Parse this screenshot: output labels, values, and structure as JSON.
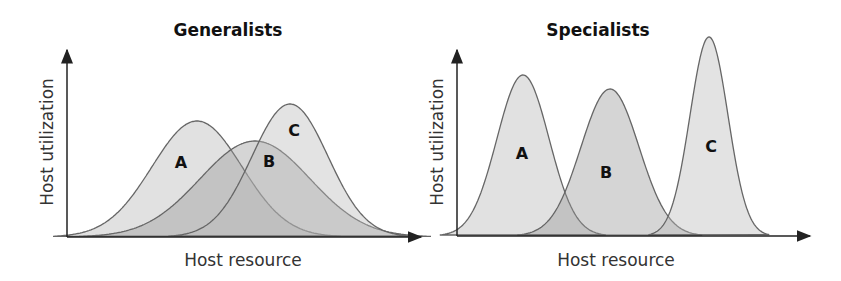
{
  "panels": [
    {
      "title": "Generalists",
      "xlabel": "Host resource",
      "ylabel": "Host utilization",
      "curves": [
        {
          "label": "A",
          "peak_x": 197,
          "peak_y": 121,
          "sigma": 45
        },
        {
          "label": "B",
          "peak_x": 255,
          "peak_y": 141,
          "sigma": 55
        },
        {
          "label": "C",
          "peak_x": 290,
          "peak_y": 104,
          "sigma": 38
        }
      ]
    },
    {
      "title": "Specialists",
      "xlabel": "Host resource",
      "ylabel": "Host utilization",
      "curves": [
        {
          "label": "A",
          "peak_x": 523,
          "peak_y": 75,
          "sigma": 26
        },
        {
          "label": "B",
          "peak_x": 610,
          "peak_y": 89,
          "sigma": 29
        },
        {
          "label": "C",
          "peak_x": 709,
          "peak_y": 37,
          "sigma": 19
        }
      ]
    }
  ],
  "chart_data": [
    {
      "type": "area",
      "title": "Generalists",
      "xlabel": "Host resource",
      "ylabel": "Host utilization",
      "series": [
        {
          "name": "A",
          "shape": "gaussian",
          "peak_position": 0.37,
          "peak_height": 0.63,
          "width": "wide"
        },
        {
          "name": "B",
          "shape": "gaussian",
          "peak_position": 0.54,
          "peak_height": 0.52,
          "width": "wide"
        },
        {
          "name": "C",
          "shape": "gaussian",
          "peak_position": 0.63,
          "peak_height": 0.72,
          "width": "wide"
        }
      ],
      "grid": false,
      "legend": "inline labels"
    },
    {
      "type": "area",
      "title": "Specialists",
      "xlabel": "Host resource",
      "ylabel": "Host utilization",
      "series": [
        {
          "name": "A",
          "shape": "gaussian",
          "peak_position": 0.19,
          "peak_height": 0.9,
          "width": "narrow"
        },
        {
          "name": "B",
          "shape": "gaussian",
          "peak_position": 0.44,
          "peak_height": 0.83,
          "width": "narrow"
        },
        {
          "name": "C",
          "shape": "gaussian",
          "peak_position": 0.72,
          "peak_height": 1.0,
          "width": "very narrow"
        }
      ],
      "grid": false,
      "legend": "inline labels"
    }
  ]
}
